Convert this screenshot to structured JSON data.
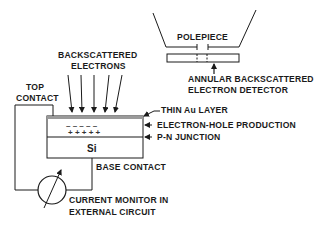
{
  "labels": {
    "polepiece": "POLEPIECE",
    "detector_line1": "ANNULAR  BACKSCATTERED",
    "detector_line2": "ELECTRON  DETECTOR",
    "bse_line1": "BACKSCATTERED",
    "bse_line2": "ELECTRONS",
    "top_contact_line1": "TOP",
    "top_contact_line2": "CONTACT",
    "au_layer": "THIN  Au  LAYER",
    "eh_production": "ELECTRON-HOLE  PRODUCTION",
    "pn_junction": "P-N  JUNCTION",
    "si": "Si",
    "base_contact": "BASE  CONTACT",
    "monitor_line1": "CURRENT  MONITOR  IN",
    "monitor_line2": "EXTERNAL  CIRCUIT"
  },
  "symbols": {
    "minus_row": "–  –  –  –  –",
    "plus_row": "+  +  +  +  +"
  },
  "colors": {
    "ink": "#1a1a1a",
    "au_layer": "#9a9a9a",
    "background": "#ffffff"
  }
}
